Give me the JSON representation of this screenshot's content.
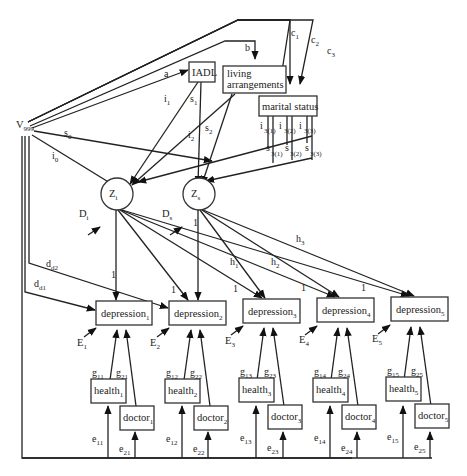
{
  "diagram": {
    "type": "structural-equation-path-diagram",
    "nodes": {
      "v999": {
        "label": "V",
        "sub": "999"
      },
      "iadl": {
        "label": "IADL"
      },
      "living": {
        "line1": "living",
        "line2": "arrangements"
      },
      "marital": {
        "label": "marital status"
      },
      "zi": {
        "label": "Z",
        "sub": "i"
      },
      "zs": {
        "label": "Z",
        "sub": "s"
      },
      "di": {
        "label": "D",
        "sub": "i"
      },
      "ds": {
        "label": "D",
        "sub": "s"
      },
      "depression": [
        {
          "label": "depression",
          "sub": "1"
        },
        {
          "label": "depression",
          "sub": "2"
        },
        {
          "label": "depression",
          "sub": "3"
        },
        {
          "label": "depression",
          "sub": "4"
        },
        {
          "label": "depression",
          "sub": "5"
        }
      ],
      "errors_E": [
        {
          "label": "E",
          "sub": "1"
        },
        {
          "label": "E",
          "sub": "2"
        },
        {
          "label": "E",
          "sub": "3"
        },
        {
          "label": "E",
          "sub": "4"
        },
        {
          "label": "E",
          "sub": "5"
        }
      ],
      "health": [
        {
          "label": "health",
          "sub": "1"
        },
        {
          "label": "health",
          "sub": "2"
        },
        {
          "label": "health",
          "sub": "3"
        },
        {
          "label": "health",
          "sub": "4"
        },
        {
          "label": "health",
          "sub": "5"
        }
      ],
      "doctor": [
        {
          "label": "doctor",
          "sub": "1"
        },
        {
          "label": "doctor",
          "sub": "2"
        },
        {
          "label": "doctor",
          "sub": "3"
        },
        {
          "label": "doctor",
          "sub": "4"
        },
        {
          "label": "doctor",
          "sub": "5"
        }
      ]
    },
    "paths": {
      "a": {
        "label": "a"
      },
      "b": {
        "label": "b"
      },
      "c1": {
        "label": "c",
        "sub": "1"
      },
      "c2": {
        "label": "c",
        "sub": "2"
      },
      "c3": {
        "label": "c",
        "sub": "3"
      },
      "i0": {
        "label": "i",
        "sub": "0"
      },
      "s0": {
        "label": "s",
        "sub": "0"
      },
      "i1": {
        "label": "i",
        "sub": "1"
      },
      "s1": {
        "label": "s",
        "sub": "1"
      },
      "i2": {
        "label": "i",
        "sub": "2"
      },
      "s2": {
        "label": "s",
        "sub": "2"
      },
      "i31": {
        "label": "i",
        "sub": "3(1)"
      },
      "i32": {
        "label": "i",
        "sub": "3(2)"
      },
      "i33": {
        "label": "i",
        "sub": "3(3)"
      },
      "s31": {
        "label": "s",
        "sub": "3(1)"
      },
      "s32": {
        "label": "s",
        "sub": "3(2)"
      },
      "s33": {
        "label": "s",
        "sub": "3(3)"
      },
      "dd1": {
        "label": "d",
        "sub": "d1"
      },
      "dd2": {
        "label": "d",
        "sub": "d2"
      },
      "h1": {
        "label": "h",
        "sub": "1"
      },
      "h2": {
        "label": "h",
        "sub": "2"
      },
      "h3": {
        "label": "h",
        "sub": "3"
      },
      "one": "1",
      "g": [
        {
          "g1": "11",
          "g2": "21"
        },
        {
          "g1": "12",
          "g2": "22"
        },
        {
          "g1": "13",
          "g2": "23"
        },
        {
          "g1": "14",
          "g2": "24"
        },
        {
          "g1": "15",
          "g2": "25"
        }
      ],
      "e": [
        {
          "e1": "11",
          "e2": "21"
        },
        {
          "e1": "12",
          "e2": "22"
        },
        {
          "e1": "13",
          "e2": "23"
        },
        {
          "e1": "14",
          "e2": "24"
        },
        {
          "e1": "15",
          "e2": "25"
        }
      ],
      "g_letter": "g",
      "e_letter": "e"
    }
  }
}
